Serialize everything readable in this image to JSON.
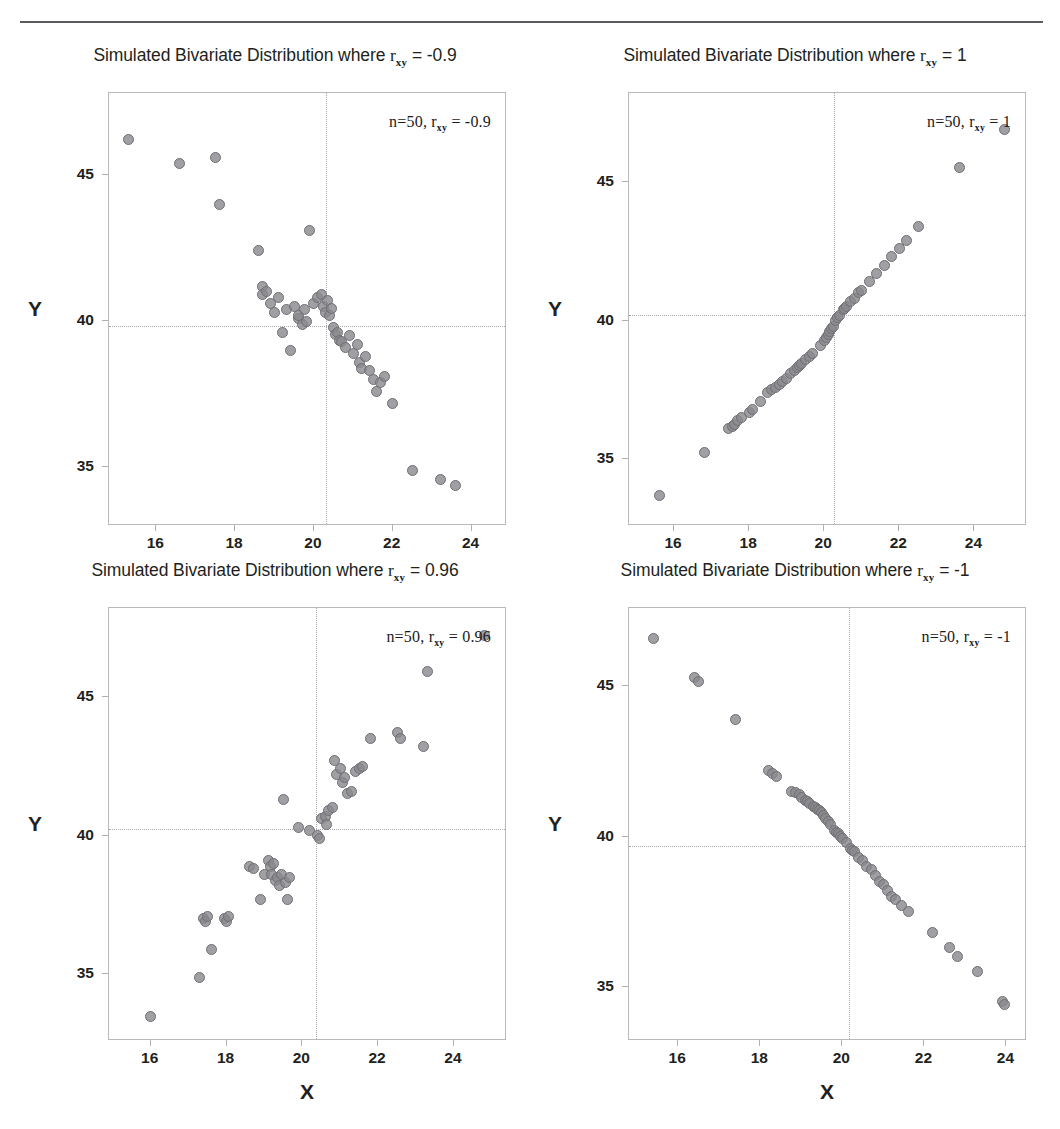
{
  "figure": {
    "shared_xlabel": "X",
    "shared_ylabel": "Y",
    "marker_color": "#88888d",
    "marker_edge_color": "#6f6f74",
    "gridline_color": "#a8a8ac",
    "frame_color": "#b9b9bd",
    "rule_color": "#5a5a5f",
    "n_label": "n=50"
  },
  "chart_data": [
    {
      "type": "scatter",
      "panel": "top-left",
      "title": "Simulated Bivariate Distribution where r_xy = -0.9",
      "title_prefix": "Simulated Bivariate Distribution where",
      "title_r": "r",
      "title_r_sub": "xy",
      "title_value": "= -0.9",
      "annotation": "n=50, r_xy = -0.9",
      "annotation_n": "n=50,",
      "annotation_r": "r",
      "annotation_r_sub": "xy",
      "annotation_value": "= -0.9",
      "n": 50,
      "r": -0.9,
      "xlabel": "X",
      "ylabel": "Y",
      "xlim": [
        14.8,
        24.9
      ],
      "ylim": [
        33.0,
        47.8
      ],
      "xticks": [
        16,
        18,
        20,
        22,
        24
      ],
      "yticks": [
        35,
        40,
        45
      ],
      "crosshair_x": 20.3,
      "crosshair_y": 39.85,
      "grid": "crosshair-dotted",
      "legend": "none",
      "x": [
        15.3,
        16.6,
        17.5,
        17.6,
        18.6,
        18.7,
        18.7,
        18.8,
        18.9,
        19.0,
        19.1,
        19.2,
        19.3,
        19.4,
        19.5,
        19.6,
        19.6,
        19.7,
        19.75,
        19.8,
        19.9,
        20.0,
        20.1,
        20.2,
        20.25,
        20.3,
        20.35,
        20.4,
        20.45,
        20.5,
        20.55,
        20.6,
        20.65,
        20.7,
        20.8,
        20.9,
        21.0,
        21.1,
        21.15,
        21.2,
        21.3,
        21.4,
        21.5,
        21.6,
        21.7,
        21.8,
        22.0,
        22.5,
        23.2,
        23.6
      ],
      "y": [
        46.2,
        45.4,
        45.6,
        44.0,
        42.4,
        41.2,
        40.9,
        41.0,
        40.6,
        40.3,
        40.8,
        39.6,
        40.4,
        39.0,
        40.5,
        40.1,
        40.2,
        39.9,
        40.4,
        40.0,
        43.1,
        40.6,
        40.8,
        40.9,
        40.5,
        40.3,
        40.7,
        40.2,
        40.45,
        39.8,
        39.55,
        39.6,
        39.35,
        39.3,
        39.1,
        39.5,
        38.9,
        39.2,
        38.6,
        38.4,
        38.8,
        38.3,
        38.0,
        37.6,
        37.9,
        38.1,
        37.2,
        34.9,
        34.6,
        34.4
      ]
    },
    {
      "type": "scatter",
      "panel": "top-right",
      "title": "Simulated Bivariate Distribution where r_xy = 1",
      "title_prefix": "Simulated Bivariate Distribution where",
      "title_r": "r",
      "title_r_sub": "xy",
      "title_value": "= 1",
      "annotation": "n=50, r_xy = 1",
      "annotation_n": "n=50,",
      "annotation_r": "r",
      "annotation_r_sub": "xy",
      "annotation_value": "= 1",
      "n": 50,
      "r": 1,
      "xlabel": "X",
      "ylabel": "Y",
      "xlim": [
        14.8,
        25.4
      ],
      "ylim": [
        32.6,
        48.2
      ],
      "xticks": [
        16,
        18,
        20,
        22,
        24
      ],
      "yticks": [
        35,
        40,
        45
      ],
      "crosshair_x": 20.25,
      "crosshair_y": 40.2,
      "grid": "crosshair-dotted",
      "legend": "none",
      "x": [
        15.6,
        16.8,
        17.45,
        17.55,
        17.6,
        17.7,
        17.8,
        18.0,
        18.1,
        18.3,
        18.5,
        18.6,
        18.7,
        18.8,
        18.9,
        19.0,
        19.1,
        19.2,
        19.3,
        19.35,
        19.4,
        19.5,
        19.6,
        19.7,
        19.9,
        20.0,
        20.05,
        20.1,
        20.15,
        20.2,
        20.25,
        20.3,
        20.35,
        20.4,
        20.5,
        20.55,
        20.6,
        20.7,
        20.8,
        20.9,
        21.0,
        21.2,
        21.4,
        21.6,
        21.8,
        22.0,
        22.2,
        22.5,
        23.6,
        24.8
      ],
      "y": [
        33.7,
        35.25,
        36.1,
        36.2,
        36.25,
        36.4,
        36.5,
        36.7,
        36.8,
        37.1,
        37.4,
        37.5,
        37.6,
        37.7,
        37.8,
        37.9,
        38.1,
        38.2,
        38.3,
        38.4,
        38.45,
        38.6,
        38.7,
        38.8,
        39.1,
        39.3,
        39.4,
        39.5,
        39.6,
        39.7,
        39.8,
        40.0,
        40.1,
        40.2,
        40.4,
        40.45,
        40.5,
        40.7,
        40.8,
        41.0,
        41.1,
        41.4,
        41.7,
        42.0,
        42.3,
        42.6,
        42.9,
        43.4,
        45.5,
        46.9
      ]
    },
    {
      "type": "scatter",
      "panel": "bottom-left",
      "title": "Simulated Bivariate Distribution where r_xy = 0.96",
      "title_prefix": "Simulated Bivariate Distribution where",
      "title_r": "r",
      "title_r_sub": "xy",
      "title_value": "= 0.96",
      "annotation": "n=50, r_xy = 0.96",
      "annotation_n": "n=50,",
      "annotation_r": "r",
      "annotation_r_sub": "xy",
      "annotation_value": "= 0.96",
      "n": 50,
      "r": 0.96,
      "xlabel": "X",
      "ylabel": "Y",
      "xlim": [
        14.9,
        25.4
      ],
      "ylim": [
        32.6,
        48.2
      ],
      "xticks": [
        16,
        18,
        20,
        22,
        24
      ],
      "yticks": [
        35,
        40,
        45
      ],
      "crosshair_x": 20.35,
      "crosshair_y": 40.25,
      "grid": "crosshair-dotted",
      "legend": "none",
      "x": [
        16.0,
        17.3,
        17.4,
        17.45,
        17.5,
        17.6,
        17.95,
        18.0,
        18.05,
        18.6,
        18.7,
        18.9,
        19.0,
        19.1,
        19.15,
        19.2,
        19.25,
        19.3,
        19.35,
        19.4,
        19.45,
        19.5,
        19.55,
        19.6,
        19.65,
        19.9,
        20.2,
        20.4,
        20.45,
        20.5,
        20.6,
        20.65,
        20.7,
        20.8,
        20.85,
        20.9,
        21.0,
        21.05,
        21.1,
        21.2,
        21.3,
        21.4,
        21.5,
        21.6,
        21.8,
        22.5,
        22.6,
        23.2,
        23.3,
        24.8
      ],
      "y": [
        33.5,
        34.9,
        37.0,
        36.9,
        37.1,
        35.9,
        37.0,
        36.9,
        37.1,
        38.9,
        38.8,
        37.7,
        38.6,
        39.1,
        38.9,
        38.6,
        39.0,
        38.4,
        38.5,
        38.2,
        38.6,
        41.3,
        38.3,
        37.7,
        38.5,
        40.3,
        40.2,
        40.0,
        39.9,
        40.6,
        40.7,
        40.4,
        40.9,
        41.0,
        42.7,
        42.2,
        42.4,
        41.9,
        42.1,
        41.5,
        41.6,
        42.3,
        42.4,
        42.5,
        43.5,
        43.7,
        43.5,
        43.2,
        45.9,
        47.2
      ]
    },
    {
      "type": "scatter",
      "panel": "bottom-right",
      "title": "Simulated Bivariate Distribution where r_xy = -1",
      "title_prefix": "Simulated Bivariate Distribution where",
      "title_r": "r",
      "title_r_sub": "xy",
      "title_value": "= -1",
      "annotation": "n=50, r_xy = -1",
      "annotation_n": "n=50,",
      "annotation_r": "r",
      "annotation_r_sub": "xy",
      "annotation_value": "= -1",
      "n": 50,
      "r": -1,
      "xlabel": "X",
      "ylabel": "Y",
      "xlim": [
        14.8,
        24.5
      ],
      "ylim": [
        33.2,
        47.6
      ],
      "xticks": [
        16,
        18,
        20,
        22,
        24
      ],
      "yticks": [
        35,
        40,
        45
      ],
      "crosshair_x": 20.15,
      "crosshair_y": 39.7,
      "grid": "crosshair-dotted",
      "legend": "none",
      "x": [
        15.4,
        16.4,
        16.5,
        17.4,
        18.2,
        18.3,
        18.4,
        18.75,
        18.85,
        18.95,
        19.0,
        19.1,
        19.15,
        19.2,
        19.3,
        19.35,
        19.4,
        19.45,
        19.5,
        19.55,
        19.6,
        19.65,
        19.7,
        19.8,
        19.85,
        19.9,
        19.95,
        20.0,
        20.1,
        20.2,
        20.25,
        20.3,
        20.4,
        20.5,
        20.6,
        20.7,
        20.8,
        20.9,
        21.0,
        21.1,
        21.2,
        21.3,
        21.45,
        21.6,
        22.2,
        22.6,
        22.8,
        23.3,
        23.9,
        23.95
      ],
      "y": [
        46.6,
        45.3,
        45.15,
        43.9,
        42.2,
        42.1,
        42.0,
        41.5,
        41.45,
        41.4,
        41.3,
        41.2,
        41.15,
        41.1,
        41.0,
        40.95,
        40.9,
        40.85,
        40.8,
        40.7,
        40.6,
        40.5,
        40.4,
        40.2,
        40.15,
        40.1,
        40.0,
        39.95,
        39.8,
        39.6,
        39.55,
        39.5,
        39.3,
        39.2,
        39.0,
        38.9,
        38.7,
        38.5,
        38.4,
        38.2,
        38.0,
        37.9,
        37.7,
        37.5,
        36.8,
        36.3,
        36.0,
        35.5,
        34.5,
        34.4
      ]
    }
  ]
}
